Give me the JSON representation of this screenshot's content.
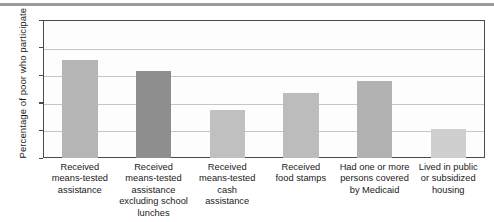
{
  "chart_data": {
    "type": "bar",
    "title": "",
    "xlabel": "",
    "ylabel": "Percentage of poor who participate",
    "ylim": [
      0,
      100
    ],
    "yticks": [
      0,
      20,
      40,
      60,
      80,
      100
    ],
    "grid": true,
    "legend": "none",
    "categories": [
      "Received means-tested assistance",
      "Received means-tested assistance excluding school lunches",
      "Received means-tested cash assistance",
      "Received food stamps",
      "Had one or more persons covered by Medicaid",
      "Lived in public or subsidized housing"
    ],
    "category_lines": [
      [
        "Received",
        "means-tested",
        "assistance"
      ],
      [
        "Received",
        "means-tested",
        "assistance",
        "excluding school",
        "lunches"
      ],
      [
        "Received",
        "means-tested",
        "cash",
        "assistance"
      ],
      [
        "Received",
        "food stamps"
      ],
      [
        "Had one or more",
        "persons covered",
        "by Medicaid"
      ],
      [
        "Lived in public",
        "or subsidized",
        "housing"
      ]
    ],
    "values": [
      71,
      63,
      35,
      47,
      56,
      21
    ],
    "bar_colors": [
      "#b5b5b5",
      "#8e8e8e",
      "#c0c0c0",
      "#bcbcbc",
      "#b2b2b2",
      "#cfcfcf"
    ]
  },
  "axis": {
    "tick_labels": [
      "0",
      "20",
      "40",
      "60",
      "80",
      "100"
    ]
  },
  "colors": {
    "frame": "#4a4a4a",
    "gridline": "#c6c6c6",
    "top_rule": "#9a9a9a",
    "text": "#1a1a1a",
    "plot_background": "#fdfdfd"
  }
}
